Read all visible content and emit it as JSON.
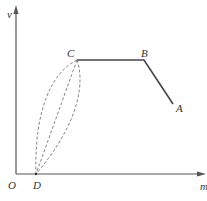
{
  "diagram": {
    "type": "process-curve",
    "axes": {
      "y_label": "v",
      "x_label": "m",
      "origin_label": "O"
    },
    "points": {
      "A": {
        "label": "A",
        "x": 173,
        "y": 104
      },
      "B": {
        "label": "B",
        "x": 144,
        "y": 60
      },
      "C": {
        "label": "C",
        "x": 77,
        "y": 60
      },
      "D": {
        "label": "D",
        "x": 36,
        "y": 174
      }
    },
    "segments": [
      {
        "from": "A",
        "to": "B",
        "style": "solid"
      },
      {
        "from": "B",
        "to": "C",
        "style": "solid"
      },
      {
        "from": "C",
        "to": "D",
        "style": "dashed",
        "shape": "left-bulging curve"
      },
      {
        "from": "C",
        "to": "D",
        "style": "dashed",
        "shape": "straight line"
      },
      {
        "from": "C",
        "to": "D",
        "style": "dashed",
        "shape": "right-bulging curve"
      }
    ],
    "colors": {
      "axis": "#555555",
      "solid_line": "#444444",
      "dashed_line": "#777777",
      "background": "#ffffff"
    }
  }
}
